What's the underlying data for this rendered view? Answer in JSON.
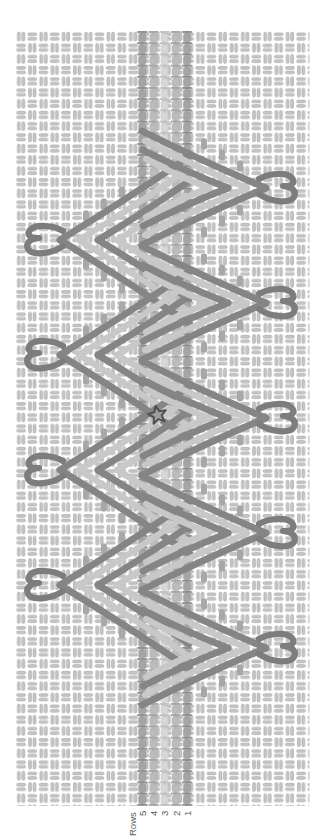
{
  "canvas": {
    "width": 335,
    "height": 839,
    "background": "#ffffff"
  },
  "texture": {
    "x": 15.5,
    "y": 31,
    "width": 294,
    "height": 775,
    "cell": 11.2,
    "bar_fill": "#c7c7c7",
    "bar_edge": "#a6a6a6"
  },
  "band": {
    "y0": 31,
    "y1": 806,
    "cell": 11.2,
    "columns": [
      {
        "cx": 142.2,
        "tone": "dark"
      },
      {
        "cx": 153.4,
        "tone": "mid"
      },
      {
        "cx": 164.6,
        "tone": "light"
      },
      {
        "cx": 175.8,
        "tone": "mid"
      },
      {
        "cx": 187.0,
        "tone": "dark"
      }
    ],
    "tones": {
      "dark": {
        "cap": "#8f8f8f",
        "body": "#a5a5a5"
      },
      "mid": {
        "cap": "#a6a6a6",
        "body": "#bcbcbc"
      },
      "light": {
        "cap": "#c2c2c2",
        "body": "#d8d8d8"
      }
    }
  },
  "motifs": {
    "stroke_dark": "#858585",
    "stroke_light": "#c8c8c8",
    "hook_color": "#7d7d7d",
    "tick_color": "#a8a8a8",
    "left": {
      "centers": [
        240,
        355,
        470,
        585
      ],
      "hook_cx": 45,
      "chevrons": [
        {
          "apex_x": 60,
          "end_x": 190,
          "dy": 84,
          "tone": "dark"
        },
        {
          "apex_x": 79,
          "end_x": 187,
          "dy": 70,
          "tone": "light"
        },
        {
          "apex_x": 98,
          "end_x": 189,
          "dy": 59,
          "tone": "dark"
        },
        {
          "apex_x": 117,
          "end_x": 185,
          "dy": 44,
          "tone": "light"
        }
      ],
      "ticks": [
        [
          86,
          -24
        ],
        [
          104,
          -36
        ],
        [
          122,
          -48
        ],
        [
          86,
          24
        ],
        [
          104,
          36
        ],
        [
          122,
          48
        ]
      ]
    },
    "right": {
      "centers": [
        188,
        303,
        418,
        533,
        648
      ],
      "hook_cx": 277,
      "chevrons": [
        {
          "apex_x": 266,
          "end_x": 142,
          "dy": 57,
          "tone": "dark"
        },
        {
          "apex_x": 247,
          "end_x": 145,
          "dy": 47,
          "tone": "light"
        },
        {
          "apex_x": 228,
          "end_x": 143,
          "dy": 38,
          "tone": "dark"
        },
        {
          "apex_x": 209,
          "end_x": 146,
          "dy": 29,
          "tone": "light"
        }
      ],
      "ticks": [
        [
          240,
          -22
        ],
        [
          222,
          -33
        ],
        [
          204,
          -44
        ],
        [
          240,
          22
        ],
        [
          222,
          33
        ],
        [
          204,
          44
        ]
      ]
    }
  },
  "star": {
    "cx": 157.5,
    "cy": 415,
    "outer_r": 9.5,
    "inner_r": 4.2,
    "rotation": -12,
    "fill": "#9e9e9e",
    "stroke": "#4f4f4f"
  },
  "labels": {
    "axis_title": "Rows",
    "row_numbers": [
      "5",
      "4",
      "3",
      "2",
      "1"
    ],
    "color": "#5c5c5c",
    "font_size": 9.5,
    "numbers_baseline_y": 816,
    "title_x": 136,
    "title_y": 836
  }
}
